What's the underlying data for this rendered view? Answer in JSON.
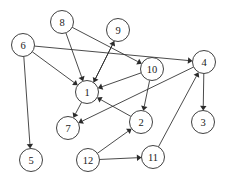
{
  "figure": {
    "background_color": "#ffffff",
    "stroke_color": "#2b2b2b",
    "node_fill_color": "#ffffff",
    "node_radius": 11.5,
    "width": 226,
    "height": 179
  },
  "chart_data": {
    "type": "diagram",
    "graph_type": "directed",
    "title": "",
    "node_count": 12,
    "edge_count": 16,
    "nodes": [
      {
        "id": "1",
        "label": "1",
        "x": 87,
        "y": 92
      },
      {
        "id": "2",
        "label": "2",
        "x": 141,
        "y": 122
      },
      {
        "id": "3",
        "label": "3",
        "x": 203,
        "y": 122
      },
      {
        "id": "4",
        "label": "4",
        "x": 204,
        "y": 62
      },
      {
        "id": "5",
        "label": "5",
        "x": 31,
        "y": 160
      },
      {
        "id": "6",
        "label": "6",
        "x": 23,
        "y": 45
      },
      {
        "id": "7",
        "label": "7",
        "x": 68,
        "y": 128
      },
      {
        "id": "8",
        "label": "8",
        "x": 62,
        "y": 22
      },
      {
        "id": "9",
        "label": "9",
        "x": 118,
        "y": 30
      },
      {
        "id": "10",
        "label": "10",
        "x": 152,
        "y": 69
      },
      {
        "id": "11",
        "label": "11",
        "x": 153,
        "y": 157
      },
      {
        "id": "12",
        "label": "12",
        "x": 88,
        "y": 160
      }
    ],
    "edges": [
      {
        "from": "6",
        "to": "4",
        "directed": true
      },
      {
        "from": "6",
        "to": "1",
        "directed": true
      },
      {
        "from": "6",
        "to": "5",
        "directed": true
      },
      {
        "from": "8",
        "to": "1",
        "directed": true
      },
      {
        "from": "8",
        "to": "10",
        "directed": true
      },
      {
        "from": "9",
        "to": "1",
        "directed": true
      },
      {
        "from": "1",
        "to": "9",
        "directed": true
      },
      {
        "from": "1",
        "to": "7",
        "directed": true
      },
      {
        "from": "10",
        "to": "1",
        "directed": true
      },
      {
        "from": "10",
        "to": "2",
        "directed": true
      },
      {
        "from": "2",
        "to": "1",
        "directed": true
      },
      {
        "from": "4",
        "to": "3",
        "directed": true
      },
      {
        "from": "4",
        "to": "7",
        "directed": true
      },
      {
        "from": "11",
        "to": "4",
        "directed": true
      },
      {
        "from": "12",
        "to": "2",
        "directed": true
      },
      {
        "from": "12",
        "to": "11",
        "directed": true
      }
    ]
  }
}
